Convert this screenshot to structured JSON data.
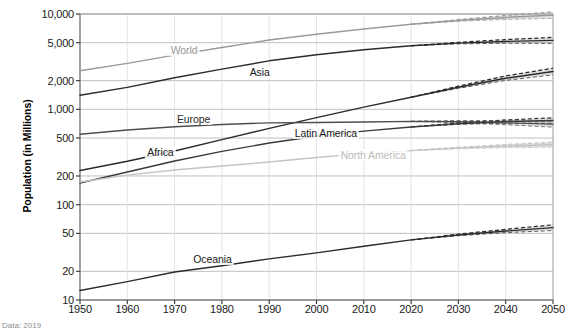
{
  "chart_data": {
    "type": "line",
    "title": "",
    "xlabel": "",
    "ylabel": "Population (in Millions)",
    "yscale": "log",
    "ylim": [
      10,
      10000
    ],
    "xlim": [
      1950,
      2050
    ],
    "grid": true,
    "legend_position": "inline-labels",
    "projection_start": 2020,
    "y_ticks": [
      {
        "value": 10000,
        "label": "10,000"
      },
      {
        "value": 5000,
        "label": "5,000"
      },
      {
        "value": 2000,
        "label": "2,000"
      },
      {
        "value": 1000,
        "label": "1,000"
      },
      {
        "value": 500,
        "label": "500"
      },
      {
        "value": 200,
        "label": "200"
      },
      {
        "value": 100,
        "label": "100"
      },
      {
        "value": 50,
        "label": "50"
      },
      {
        "value": 20,
        "label": "20"
      },
      {
        "value": 10,
        "label": "10"
      }
    ],
    "x_ticks": [
      {
        "value": 1950,
        "label": "1950"
      },
      {
        "value": 1960,
        "label": "1960"
      },
      {
        "value": 1970,
        "label": "1970"
      },
      {
        "value": 1980,
        "label": "1980"
      },
      {
        "value": 1990,
        "label": "1990"
      },
      {
        "value": 2000,
        "label": "2000"
      },
      {
        "value": 2010,
        "label": "2010"
      },
      {
        "value": 2020,
        "label": "2020"
      },
      {
        "value": 2030,
        "label": "2030"
      },
      {
        "value": 2040,
        "label": "2040"
      },
      {
        "value": 2050,
        "label": "2050"
      }
    ],
    "x": [
      1950,
      1960,
      1970,
      1980,
      1990,
      2000,
      2010,
      2020,
      2030,
      2040,
      2050
    ],
    "series": [
      {
        "name": "World",
        "color": "#9a9a9a",
        "label_color": "#9a9a9a",
        "label_x": 1972,
        "label_y": 4200,
        "values": [
          2536,
          3034,
          3700,
          4458,
          5327,
          6143,
          6957,
          7795,
          8548,
          9199,
          9735
        ],
        "band_low": [
          null,
          null,
          null,
          null,
          null,
          null,
          null,
          7795,
          8390,
          8760,
          9000
        ],
        "band_high": [
          null,
          null,
          null,
          null,
          null,
          null,
          null,
          7795,
          8720,
          9660,
          10500
        ]
      },
      {
        "name": "Asia",
        "color": "#2b2b2b",
        "label_color": "#1a1a1a",
        "label_x": 1988,
        "label_y": 2450,
        "values": [
          1405,
          1700,
          2140,
          2642,
          3226,
          3741,
          4210,
          4641,
          4947,
          5154,
          5290
        ],
        "band_low": [
          null,
          null,
          null,
          null,
          null,
          null,
          null,
          4641,
          4860,
          4930,
          4920
        ],
        "band_high": [
          null,
          null,
          null,
          null,
          null,
          null,
          null,
          4641,
          5040,
          5390,
          5680
        ]
      },
      {
        "name": "Africa",
        "color": "#2b2b2b",
        "label_color": "#1a1a1a",
        "label_x": 1967,
        "label_y": 360,
        "values": [
          228,
          285,
          366,
          481,
          631,
          818,
          1055,
          1341,
          1703,
          2120,
          2489
        ],
        "band_low": [
          null,
          null,
          null,
          null,
          null,
          null,
          null,
          1341,
          1660,
          2010,
          2300
        ],
        "band_high": [
          null,
          null,
          null,
          null,
          null,
          null,
          null,
          1341,
          1750,
          2240,
          2700
        ]
      },
      {
        "name": "Europe",
        "color": "#4d4d4d",
        "label_color": "#2b2b2b",
        "label_x": 1974,
        "label_y": 800,
        "values": [
          549,
          606,
          657,
          694,
          721,
          726,
          736,
          748,
          741,
          722,
          700
        ],
        "band_low": [
          null,
          null,
          null,
          null,
          null,
          null,
          null,
          748,
          726,
          690,
          650
        ],
        "band_high": [
          null,
          null,
          null,
          null,
          null,
          null,
          null,
          748,
          757,
          755,
          750
        ]
      },
      {
        "name": "Latin America",
        "color": "#3a3a3a",
        "label_color": "#1a1a1a",
        "label_x": 2002,
        "label_y": 560,
        "values": [
          169,
          220,
          287,
          362,
          443,
          522,
          591,
          654,
          706,
          744,
          762
        ],
        "band_low": [
          null,
          null,
          null,
          null,
          null,
          null,
          null,
          654,
          694,
          716,
          712
        ],
        "band_high": [
          null,
          null,
          null,
          null,
          null,
          null,
          null,
          654,
          719,
          773,
          815
        ]
      },
      {
        "name": "North America",
        "color": "#c4c4c4",
        "label_color": "#bdbdbd",
        "label_x": 2012,
        "label_y": 330,
        "values": [
          173,
          204,
          231,
          254,
          280,
          313,
          343,
          369,
          392,
          411,
          425
        ],
        "band_low": [
          null,
          null,
          null,
          null,
          null,
          null,
          null,
          369,
          385,
          396,
          400
        ],
        "band_high": [
          null,
          null,
          null,
          null,
          null,
          null,
          null,
          369,
          400,
          427,
          452
        ]
      },
      {
        "name": "Oceania",
        "color": "#2b2b2b",
        "label_color": "#1a1a1a",
        "label_x": 1978,
        "label_y": 27,
        "values": [
          12.6,
          15.6,
          19.7,
          22.9,
          27.0,
          31.2,
          36.7,
          42.7,
          48.1,
          52.9,
          57.4
        ],
        "band_low": [
          null,
          null,
          null,
          null,
          null,
          null,
          null,
          42.7,
          47.2,
          50.9,
          53.5
        ],
        "band_high": [
          null,
          null,
          null,
          null,
          null,
          null,
          null,
          42.7,
          49.1,
          55.1,
          61.5
        ]
      }
    ]
  },
  "source_note": "Data: 2019"
}
